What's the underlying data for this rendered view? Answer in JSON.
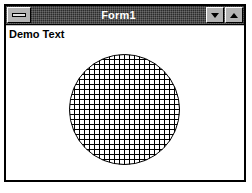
{
  "window": {
    "title": "Form1",
    "system_menu_icon": "system-menu-box-icon",
    "caption_buttons": [
      {
        "name": "minimize",
        "icon": "triangle-down-icon",
        "label": ""
      },
      {
        "name": "maximize",
        "icon": "triangle-up-icon",
        "label": ""
      }
    ],
    "frame_color": "#000000",
    "titlebar_color": "#2b2b2b",
    "titlebar_text_color": "#ffffff",
    "face_color": "#c0c0c0"
  },
  "client": {
    "background_color": "#ffffff",
    "label": "Demo Text",
    "graphic": {
      "shape": "circle",
      "fill_style": "cross-hatch-grid",
      "center_x": 55.5,
      "center_y": 55.5,
      "radius": 55,
      "grid_spacing": 5,
      "line_color": "#000000",
      "line_width": 1
    }
  }
}
